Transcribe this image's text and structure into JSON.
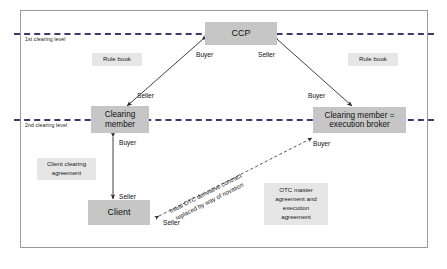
{
  "diagram": {
    "levels": [
      {
        "label": "1st clearing level"
      },
      {
        "label": "2nd clearing level"
      }
    ],
    "nodes": [
      {
        "id": "ccp",
        "label": "CCP"
      },
      {
        "id": "clearing_member",
        "line1": "Clearing",
        "line2": "member"
      },
      {
        "id": "execution_broker",
        "line1": "Clearing member =",
        "line2": "execution broker"
      },
      {
        "id": "client",
        "label": "Client"
      }
    ],
    "notes": [
      {
        "id": "rule_book_left",
        "label": "Rule book"
      },
      {
        "id": "rule_book_right",
        "label": "Rule book"
      },
      {
        "id": "client_clearing_agreement",
        "line1": "Client clearing",
        "line2": "agreement"
      },
      {
        "id": "otc_master_agreement",
        "line1": "OTC master",
        "line2": "agreement and",
        "line3": "execution",
        "line4": "agreement"
      }
    ],
    "roles": [
      {
        "id": "ccp_buyer",
        "label": "Buyer"
      },
      {
        "id": "ccp_seller",
        "label": "Seller"
      },
      {
        "id": "cm_seller",
        "label": "Seller"
      },
      {
        "id": "broker_buyer_top",
        "label": "Buyer"
      },
      {
        "id": "cm_buyer_down",
        "label": "Buyer"
      },
      {
        "id": "client_seller",
        "label": "Seller"
      },
      {
        "id": "broker_buyer_bottom",
        "label": "Buyer"
      },
      {
        "id": "client_seller_otc",
        "label": "Seller"
      }
    ],
    "novation_caption": {
      "line1": "Initial OTC derivative contract",
      "line2": "replaced by way of novation"
    },
    "colors": {
      "node_fill": "#c6c6c6",
      "note_fill": "#e6e6e6",
      "divider": "#3a3a6e",
      "frame": "#9a9a9a",
      "arrow": "#2b2b2b"
    }
  }
}
